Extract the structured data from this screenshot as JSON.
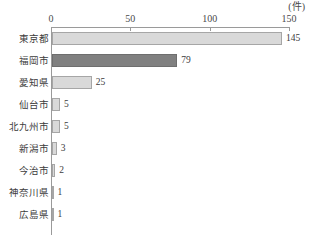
{
  "chart_data": {
    "type": "bar",
    "orientation": "horizontal",
    "title": "",
    "subtitle": "",
    "xlabel": "",
    "ylabel": "",
    "unit_label": "(件)",
    "xlim": [
      0,
      150
    ],
    "ticks": [
      0,
      50,
      100,
      150
    ],
    "tick_labels": [
      "0",
      "50",
      "100",
      "150"
    ],
    "grid": false,
    "legend": "none",
    "axis_position": "top",
    "categories": [
      "東京都",
      "福岡市",
      "愛知県",
      "仙台市",
      "北九州市",
      "新潟市",
      "今治市",
      "神奈川県",
      "広島県"
    ],
    "values": [
      145,
      79,
      25,
      5,
      5,
      3,
      2,
      1,
      1
    ],
    "value_labels": [
      "145",
      "79",
      "25",
      "5",
      "5",
      "3",
      "2",
      "1",
      "1"
    ],
    "highlighted_index": 1,
    "colors": {
      "bar": "#d9d9d9",
      "bar_border": "#a6a6a6",
      "bar_highlight": "#808080",
      "bar_highlight_border": "#6e6e6e",
      "axis": "#9a9a9a",
      "text": "#3c3c3c"
    }
  }
}
